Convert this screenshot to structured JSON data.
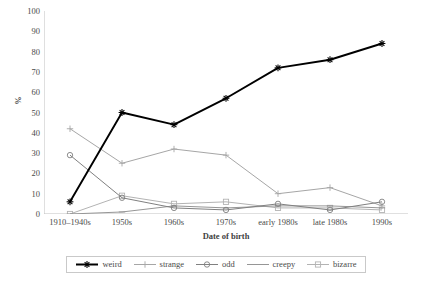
{
  "chart_data": {
    "type": "line",
    "title": "",
    "xlabel": "Date of birth",
    "ylabel": "%",
    "categories": [
      "1910–1940s",
      "1950s",
      "1960s",
      "1970s",
      "early 1980s",
      "late 1980s",
      "1990s"
    ],
    "ylim": [
      0,
      100
    ],
    "y_ticks": [
      0,
      10,
      20,
      30,
      40,
      50,
      60,
      70,
      80,
      90,
      100
    ],
    "grid": false,
    "legend_position": "bottom",
    "series": [
      {
        "name": "weird",
        "color": "#000000",
        "marker": "star",
        "values": [
          6,
          50,
          44,
          57,
          72,
          76,
          84
        ]
      },
      {
        "name": "strange",
        "color": "#a6a6a6",
        "marker": "plus",
        "values": [
          42,
          25,
          32,
          29,
          10,
          13,
          4
        ]
      },
      {
        "name": "odd",
        "color": "#808080",
        "marker": "circle",
        "values": [
          29,
          8,
          3,
          2,
          5,
          2,
          6
        ]
      },
      {
        "name": "creepy",
        "color": "#969696",
        "marker": "dash",
        "values": [
          0,
          1,
          4,
          3,
          4,
          4,
          3
        ]
      },
      {
        "name": "bizarre",
        "color": "#b3b3b3",
        "marker": "square",
        "values": [
          0,
          9,
          5,
          6,
          3,
          3,
          2
        ]
      }
    ]
  },
  "axes": {
    "y_tick_labels": [
      "100",
      "90",
      "80",
      "70",
      "60",
      "50",
      "40",
      "30",
      "20",
      "10",
      "0"
    ],
    "y_axis_title": "%",
    "x_tick_labels": [
      "1910–1940s",
      "1950s",
      "1960s",
      "1970s",
      "early 1980s",
      "late 1980s",
      "1990s"
    ],
    "x_axis_title": "Date of birth"
  },
  "legend": {
    "items": [
      {
        "label": "weird"
      },
      {
        "label": "strange"
      },
      {
        "label": "odd"
      },
      {
        "label": "creepy"
      },
      {
        "label": "bizarre"
      }
    ]
  }
}
